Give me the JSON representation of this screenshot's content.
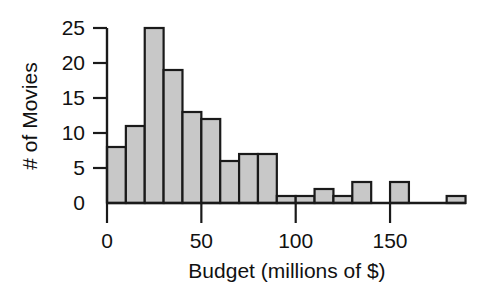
{
  "chart_data": {
    "type": "bar",
    "subtype": "histogram",
    "title": "",
    "xlabel": "Budget (millions of $)",
    "ylabel": "# of Movies",
    "xlim": [
      0,
      190
    ],
    "ylim": [
      0,
      25
    ],
    "bin_width": 10,
    "grid": false,
    "legend": null,
    "xticks": [
      0,
      50,
      100,
      150
    ],
    "xtick_labels": [
      "0",
      "50",
      "100",
      "150"
    ],
    "yticks": [
      0,
      5,
      10,
      15,
      20,
      25
    ],
    "ytick_labels": [
      "0",
      "5",
      "10",
      "15",
      "20",
      "25"
    ],
    "bin_edges": [
      0,
      10,
      20,
      30,
      40,
      50,
      60,
      70,
      80,
      90,
      100,
      110,
      120,
      130,
      140,
      150,
      160,
      170,
      180,
      190
    ],
    "bin_starts": [
      0,
      10,
      20,
      30,
      40,
      50,
      60,
      70,
      80,
      90,
      100,
      110,
      120,
      130,
      140,
      150,
      160,
      170,
      180
    ],
    "categories": [
      "0-10",
      "10-20",
      "20-30",
      "30-40",
      "40-50",
      "50-60",
      "60-70",
      "70-80",
      "80-90",
      "90-100",
      "100-110",
      "110-120",
      "120-130",
      "130-140",
      "140-150",
      "150-160",
      "160-170",
      "170-180",
      "180-190"
    ],
    "values": [
      8,
      11,
      25,
      19,
      13,
      12,
      6,
      7,
      7,
      1,
      1,
      2,
      1,
      3,
      0,
      3,
      0,
      0,
      1
    ],
    "bar_fill": "#c8c8c8",
    "bar_stroke": "#1a1a1a",
    "axis_color": "#1a1a1a"
  }
}
